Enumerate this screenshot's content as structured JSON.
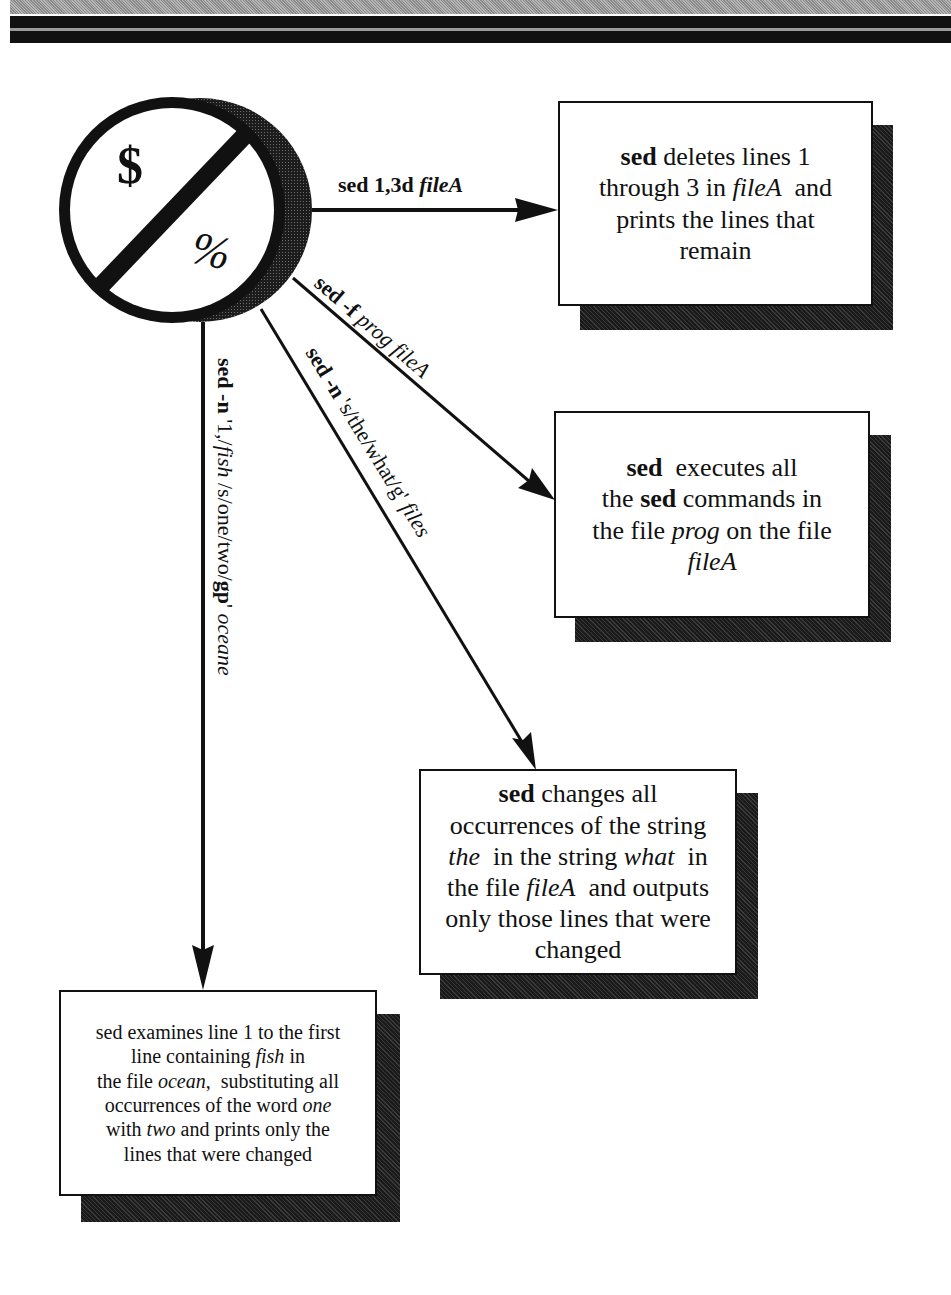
{
  "header": {
    "bands": [
      "gray-stipple",
      "black",
      "black"
    ]
  },
  "hub": {
    "top_symbol": "$",
    "bottom_symbol": "%",
    "icon": "no-sign-slash-icon"
  },
  "arrows": [
    {
      "id": "delete",
      "label_parts": [
        {
          "text": "sed 1,3d ",
          "style": "bold"
        },
        {
          "text": "fileA",
          "style": "bold-italic"
        }
      ],
      "direction": "horizontal-right"
    },
    {
      "id": "script",
      "label_parts": [
        {
          "text": "sed -f ",
          "style": "bold"
        },
        {
          "text": "prog fileA",
          "style": "italic"
        }
      ],
      "direction": "diagonal-down-right"
    },
    {
      "id": "substitute",
      "label_parts": [
        {
          "text": "sed -n ",
          "style": "bold"
        },
        {
          "text": "'s/the/what/g' ",
          "style": "regular"
        },
        {
          "text": "files",
          "style": "italic"
        }
      ],
      "direction": "diagonal-down"
    },
    {
      "id": "range",
      "label_parts": [
        {
          "text": "sed -n ",
          "style": "bold"
        },
        {
          "text": "'1,/",
          "style": "regular"
        },
        {
          "text": "fish ",
          "style": "italic"
        },
        {
          "text": "/s/one/two/",
          "style": "regular"
        },
        {
          "text": "gp",
          "style": "bold"
        },
        {
          "text": "' ",
          "style": "regular"
        },
        {
          "text": "oceane",
          "style": "italic"
        }
      ],
      "direction": "vertical-down"
    }
  ],
  "boxes": [
    {
      "id": "box-delete",
      "lines": [
        [
          {
            "t": "sed",
            "s": "bold"
          },
          {
            "t": " deletes lines 1",
            "s": "regular"
          }
        ],
        [
          {
            "t": "through 3 in ",
            "s": "regular"
          },
          {
            "t": "fileA",
            "s": "italic"
          },
          {
            "t": "  and",
            "s": "regular"
          }
        ],
        [
          {
            "t": "prints the lines that",
            "s": "regular"
          }
        ],
        [
          {
            "t": "remain",
            "s": "regular"
          }
        ]
      ]
    },
    {
      "id": "box-script",
      "lines": [
        [
          {
            "t": "sed",
            "s": "bold"
          },
          {
            "t": "  executes all",
            "s": "regular"
          }
        ],
        [
          {
            "t": "the ",
            "s": "regular"
          },
          {
            "t": "sed",
            "s": "bold"
          },
          {
            "t": " commands in",
            "s": "regular"
          }
        ],
        [
          {
            "t": "the file ",
            "s": "regular"
          },
          {
            "t": "prog",
            "s": "italic"
          },
          {
            "t": " on the file",
            "s": "regular"
          }
        ],
        [
          {
            "t": "fileA",
            "s": "italic"
          }
        ]
      ]
    },
    {
      "id": "box-substitute",
      "lines": [
        [
          {
            "t": "sed",
            "s": "bold"
          },
          {
            "t": " changes all",
            "s": "regular"
          }
        ],
        [
          {
            "t": "occurrences of the string",
            "s": "regular"
          }
        ],
        [
          {
            "t": "the",
            "s": "italic"
          },
          {
            "t": "  in the string ",
            "s": "regular"
          },
          {
            "t": "what",
            "s": "italic"
          },
          {
            "t": "  in",
            "s": "regular"
          }
        ],
        [
          {
            "t": "the file ",
            "s": "regular"
          },
          {
            "t": "fileA",
            "s": "italic"
          },
          {
            "t": "  and outputs",
            "s": "regular"
          }
        ],
        [
          {
            "t": "only those lines that were",
            "s": "regular"
          }
        ],
        [
          {
            "t": "changed",
            "s": "regular"
          }
        ]
      ]
    },
    {
      "id": "box-range",
      "lines": [
        [
          {
            "t": "sed examines line 1 to the first",
            "s": "regular"
          }
        ],
        [
          {
            "t": "line containing ",
            "s": "regular"
          },
          {
            "t": "fish",
            "s": "italic"
          },
          {
            "t": " in",
            "s": "regular"
          }
        ],
        [
          {
            "t": "the file ",
            "s": "regular"
          },
          {
            "t": "ocean",
            "s": "italic"
          },
          {
            "t": ",  substituting all",
            "s": "regular"
          }
        ],
        [
          {
            "t": "occurrences of the word ",
            "s": "regular"
          },
          {
            "t": "one",
            "s": "italic"
          }
        ],
        [
          {
            "t": "with ",
            "s": "regular"
          },
          {
            "t": "two",
            "s": "italic"
          },
          {
            "t": " and prints only the",
            "s": "regular"
          }
        ],
        [
          {
            "t": "lines that were changed",
            "s": "regular"
          }
        ]
      ]
    }
  ],
  "colors": {
    "ink": "#111111",
    "shadow": "#2a2a2a",
    "paper": "#ffffff"
  }
}
